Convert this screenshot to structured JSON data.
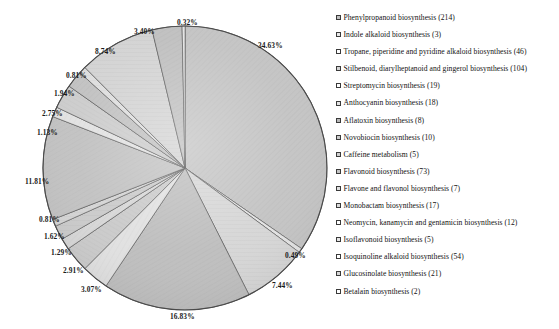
{
  "chart_data": {
    "type": "pie",
    "title": "",
    "total_count": 618,
    "legend_position": "right",
    "grid": false,
    "categories": [
      "Phenylpropanoid biosynthesis",
      "Indole alkaloid biosynthesis",
      "Tropane, piperidine and pyridine alkaloid biosynthesis",
      "Stilbenoid, diarylheptanoid and gingerol biosynthesis",
      "Streptomycin biosynthesis",
      "Anthocyanin biosynthesis",
      "Aflatoxin biosynthesis",
      "Novobiocin biosynthesis",
      "Caffeine metabolism",
      "Flavonoid biosynthesis",
      "Flavone and flavonol biosynthesis",
      "Monobactam biosynthesis",
      "Neomycin, kanamycin and gentamicin biosynthesis",
      "Isoflavonoid biosynthesis",
      "Isoquinoline alkaloid biosynthesis",
      "Glucosinolate biosynthesis",
      "Betalain biosynthesis"
    ],
    "counts": [
      214,
      3,
      46,
      104,
      19,
      18,
      8,
      10,
      5,
      73,
      7,
      17,
      12,
      5,
      54,
      21,
      2
    ],
    "values": [
      34.63,
      0.49,
      7.44,
      16.83,
      3.07,
      2.91,
      1.29,
      1.62,
      0.81,
      11.81,
      1.13,
      2.75,
      1.94,
      0.81,
      8.74,
      3.4,
      0.32
    ],
    "value_labels": [
      "34.63%",
      "0.49%",
      "7.44%",
      "16.83%",
      "3.07%",
      "2.91%",
      "1.29%",
      "1.62%",
      "0.81%",
      "11.81%",
      "1.13%",
      "2.75%",
      "1.94%",
      "0.81%",
      "8.74%",
      "3.40%",
      "0.32%"
    ],
    "slice_colors": [
      "#c0c0c0",
      "#e8e8e8",
      "#d4d4d4",
      "#bcbcbc",
      "#dedede",
      "#c8c8c8",
      "#e4e4e4",
      "#b8b8b8",
      "#d0d0d0",
      "#c4c4c4",
      "#e0e0e0",
      "#cccccc",
      "#bdbdbd",
      "#dcdcdc",
      "#cfcfcf",
      "#bfbfbf",
      "#e6e6e6"
    ],
    "stroke_color": "#4a4a4a",
    "start_angle_deg": 0,
    "direction": "clockwise"
  },
  "legend": {
    "items": [
      {
        "label": "Phenylpropanoid biosynthesis (214)",
        "swatch": "pattern-swatch-1"
      },
      {
        "label": "Indole alkaloid biosynthesis (3)",
        "swatch": "pattern-swatch-2"
      },
      {
        "label": "Tropane, piperidine and pyridine alkaloid biosynthesis (46)",
        "swatch": "pattern-swatch-3"
      },
      {
        "label": "Stilbenoid, diarylheptanoid and gingerol biosynthesis (104)",
        "swatch": "pattern-swatch-4"
      },
      {
        "label": "Streptomycin biosynthesis (19)",
        "swatch": "pattern-swatch-5"
      },
      {
        "label": "Anthocyanin biosynthesis (18)",
        "swatch": "pattern-swatch-6"
      },
      {
        "label": "Aflatoxin biosynthesis (8)",
        "swatch": "pattern-swatch-7"
      },
      {
        "label": "Novobiocin biosynthesis (10)",
        "swatch": "pattern-swatch-8"
      },
      {
        "label": "Caffeine metabolism (5)",
        "swatch": "pattern-swatch-9"
      },
      {
        "label": "Flavonoid biosynthesis (73)",
        "swatch": "pattern-swatch-10"
      },
      {
        "label": "Flavone and flavonol biosynthesis (7)",
        "swatch": "pattern-swatch-11"
      },
      {
        "label": "Monobactam biosynthesis (17)",
        "swatch": "pattern-swatch-12"
      },
      {
        "label": "Neomycin, kanamycin and gentamicin biosynthesis (12)",
        "swatch": "pattern-swatch-13"
      },
      {
        "label": "Isoflavonoid biosynthesis (5)",
        "swatch": "pattern-swatch-14"
      },
      {
        "label": "Isoquinoline alkaloid biosynthesis (54)",
        "swatch": "pattern-swatch-15"
      },
      {
        "label": "Glucosinolate biosynthesis (21)",
        "swatch": "pattern-swatch-16"
      },
      {
        "label": "Betalain biosynthesis (2)",
        "swatch": "pattern-swatch-17"
      }
    ]
  },
  "pie_geometry": {
    "center_x": 185,
    "center_y": 168,
    "radius": 142
  },
  "label_positions": [
    {
      "text": "34.63%",
      "x": 258,
      "y": 41
    },
    {
      "text": "0.49%",
      "x": 285,
      "y": 251
    },
    {
      "text": "7.44%",
      "x": 272,
      "y": 281
    },
    {
      "text": "16.83%",
      "x": 170,
      "y": 312
    },
    {
      "text": "3.07%",
      "x": 81,
      "y": 285
    },
    {
      "text": "2.91%",
      "x": 63,
      "y": 266
    },
    {
      "text": "1.29%",
      "x": 51,
      "y": 248
    },
    {
      "text": "1.62%",
      "x": 44,
      "y": 232
    },
    {
      "text": "0.81%",
      "x": 39,
      "y": 215
    },
    {
      "text": "11.81%",
      "x": 25,
      "y": 177
    },
    {
      "text": "1.13%",
      "x": 37,
      "y": 128
    },
    {
      "text": "2.75%",
      "x": 42,
      "y": 109
    },
    {
      "text": "1.94%",
      "x": 54,
      "y": 89
    },
    {
      "text": "0.81%",
      "x": 66,
      "y": 71
    },
    {
      "text": "8.74%",
      "x": 95,
      "y": 47
    },
    {
      "text": "3.40%",
      "x": 134,
      "y": 27
    },
    {
      "text": "0.32%",
      "x": 177,
      "y": 18
    }
  ]
}
